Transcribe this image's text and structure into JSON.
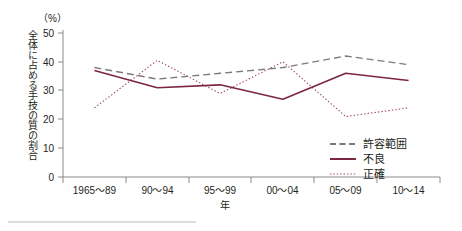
{
  "chart_data": {
    "type": "line",
    "title": "",
    "xlabel": "年",
    "ylabel": "全体に占める手技の質の割合",
    "unit_label": "（%）",
    "categories": [
      "1965〜89",
      "90〜94",
      "95〜99",
      "00〜04",
      "05〜09",
      "10〜14"
    ],
    "ylim": [
      0,
      50
    ],
    "yticks": [
      0,
      10,
      20,
      30,
      40,
      50
    ],
    "ytick_labels": [
      "0",
      "10",
      "20",
      "30",
      "40",
      "50"
    ],
    "grid": false,
    "legend_position": "right-middle",
    "series": [
      {
        "name": "許容範囲",
        "style": "dashed",
        "color": "#7b7b7b",
        "values": [
          38,
          34,
          36,
          38,
          42,
          39
        ]
      },
      {
        "name": "不良",
        "style": "solid",
        "color": "#7d2640",
        "values": [
          37,
          31,
          32,
          27,
          36,
          33.5
        ]
      },
      {
        "name": "正確",
        "style": "dotted",
        "color": "#a04a58",
        "values": [
          24,
          40.5,
          29,
          40,
          21,
          24
        ]
      }
    ]
  },
  "legend": {
    "items": [
      {
        "label": "許容範囲",
        "style": "dashed"
      },
      {
        "label": "不良",
        "style": "solid"
      },
      {
        "label": "正確",
        "style": "dotted"
      }
    ]
  },
  "axes": {
    "y_unit": "（%）",
    "y_title": "全体に占める手技の質の割合",
    "x_title": "年"
  }
}
